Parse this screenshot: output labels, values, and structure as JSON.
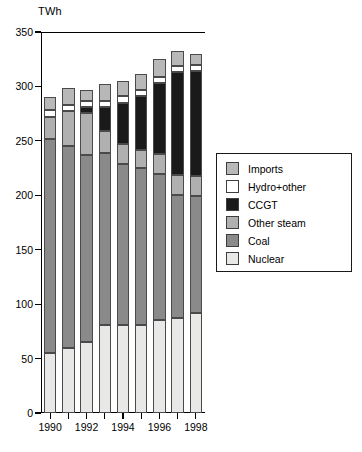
{
  "chart_data": {
    "type": "bar",
    "subtype": "stacked-vertical",
    "title": "",
    "subtitle": "",
    "xlabel": "",
    "ylabel": "TWh",
    "unit_label": "TWh",
    "categories": [
      "1990",
      "1991",
      "1992",
      "1993",
      "1994",
      "1995",
      "1996",
      "1997",
      "1998"
    ],
    "x_tick_labels": [
      "1990",
      "",
      "1992",
      "",
      "1994",
      "",
      "1996",
      "",
      "1998"
    ],
    "y_tick_labels": [
      "0",
      "50",
      "100",
      "150",
      "200",
      "250",
      "300",
      "350"
    ],
    "y_ticks": [
      0,
      50,
      100,
      150,
      200,
      250,
      300,
      350
    ],
    "ylim": [
      0,
      350
    ],
    "grid": false,
    "legend_position": "right-outside",
    "series": [
      {
        "name": "Nuclear",
        "color": "#e8e8e6",
        "values": [
          55,
          60,
          65,
          81,
          81,
          81,
          85,
          87,
          92
        ]
      },
      {
        "name": "Coal",
        "color": "#8a8a8a",
        "values": [
          197,
          185,
          172,
          158,
          148,
          144,
          135,
          113,
          107
        ]
      },
      {
        "name": "Other steam",
        "color": "#b0b0b0",
        "values": [
          20,
          32,
          39,
          20,
          18,
          17,
          18,
          19,
          19
        ]
      },
      {
        "name": "CCGT",
        "color": "#1a1a1a",
        "values": [
          0,
          0,
          5,
          22,
          38,
          49,
          65,
          94,
          96
        ]
      },
      {
        "name": "Hydro+other",
        "color": "#ffffff",
        "values": [
          6,
          6,
          6,
          6,
          6,
          6,
          6,
          6,
          6
        ]
      },
      {
        "name": "Imports",
        "color": "#b8b8b8",
        "values": [
          12,
          16,
          10,
          15,
          14,
          14,
          16,
          14,
          10
        ]
      }
    ],
    "totals": [
      290,
      299,
      297,
      302,
      305,
      311,
      325,
      333,
      330
    ],
    "legend_entries": [
      {
        "label": "Imports",
        "color": "#b8b8b8"
      },
      {
        "label": "Hydro+other",
        "color": "#ffffff"
      },
      {
        "label": "CCGT",
        "color": "#1a1a1a"
      },
      {
        "label": "Other steam",
        "color": "#b0b0b0"
      },
      {
        "label": "Coal",
        "color": "#8a8a8a"
      },
      {
        "label": "Nuclear",
        "color": "#e8e8e6"
      }
    ]
  }
}
